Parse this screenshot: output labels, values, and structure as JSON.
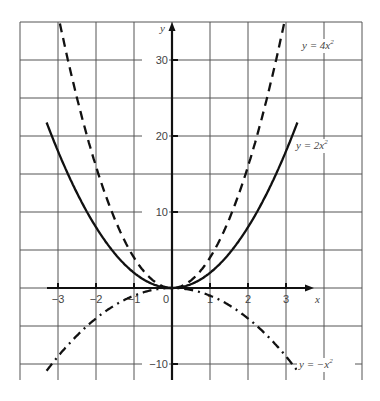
{
  "chart_data": {
    "type": "line",
    "title": "",
    "xlabel": "x",
    "ylabel": "y",
    "xlim": [
      -3.9,
      5.0
    ],
    "ylim": [
      -12.1,
      35.0
    ],
    "grid": true,
    "x_ticks": [
      -3,
      -2,
      -1,
      0,
      1,
      2,
      3
    ],
    "y_ticks": [
      -10,
      10,
      20,
      30
    ],
    "x_tick_labels": [
      "−3",
      "−2",
      "−1",
      "0",
      "1",
      "2",
      "3"
    ],
    "y_tick_labels": [
      "−10",
      "10",
      "20",
      "30"
    ],
    "series": [
      {
        "name": "y = 4x²",
        "label": "y = 4x",
        "exponent": "2",
        "style": "dashed",
        "coef": 4,
        "x_range": [
          -2.95,
          2.95
        ]
      },
      {
        "name": "y = 2x²",
        "label": "y = 2x",
        "exponent": "2",
        "style": "solid",
        "coef": 2,
        "x_range": [
          -3.3,
          3.3
        ]
      },
      {
        "name": "y = −x²",
        "label": "y = −x",
        "exponent": "2",
        "style": "dash-dot",
        "coef": -1,
        "x_range": [
          -3.3,
          3.3
        ]
      }
    ],
    "legend": "inline labels near curve ends"
  }
}
